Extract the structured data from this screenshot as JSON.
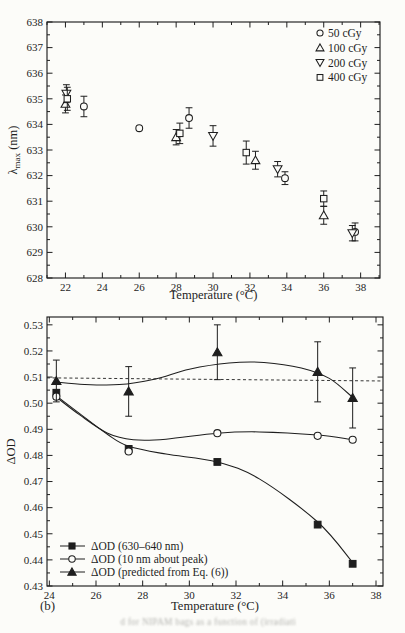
{
  "figure": {
    "panel_label": "(b)",
    "caption_fragment": "d for NIPAM bags as a function of (irradiati",
    "background": "#fcfcf9",
    "ink": "#1e1e1e"
  },
  "chart_data": [
    {
      "type": "scatter",
      "title": "",
      "xlabel": "Temperature (°C)",
      "ylabel": "λmax (nm)",
      "ylabel_parts": [
        {
          "t": "λ"
        },
        {
          "t": "max",
          "sub": true
        },
        {
          "t": " (nm)"
        }
      ],
      "xlim": [
        21,
        39.05
      ],
      "ylim": [
        628,
        638
      ],
      "xticks": [
        22,
        24,
        26,
        28,
        30,
        32,
        34,
        36,
        38
      ],
      "xminor_step": 1,
      "yticks": [
        628,
        629,
        630,
        631,
        632,
        633,
        634,
        635,
        636,
        637,
        638
      ],
      "yminor_step": 0.5,
      "y_decimals": 0,
      "grid": false,
      "legend": {
        "position": "top-right",
        "style": "marker"
      },
      "series": [
        {
          "name": "50 cGy",
          "marker": "circle",
          "fill": "open",
          "points": [
            [
              23.0,
              634.7,
              0.4
            ],
            [
              26.0,
              633.85,
              0
            ],
            [
              28.7,
              634.25,
              0.4
            ],
            [
              33.9,
              631.9,
              0.25
            ],
            [
              37.7,
              629.8,
              0.35
            ]
          ]
        },
        {
          "name": "100 cGy",
          "marker": "triangle-up",
          "fill": "open",
          "points": [
            [
              22.0,
              634.8,
              0.35
            ],
            [
              28.0,
              633.5,
              0.3
            ],
            [
              32.3,
              632.6,
              0.35
            ],
            [
              36.0,
              630.45,
              0.35
            ]
          ]
        },
        {
          "name": "200 cGy",
          "marker": "triangle-down",
          "fill": "open",
          "points": [
            [
              22.05,
              635.2,
              0.35
            ],
            [
              30.0,
              633.55,
              0.4
            ],
            [
              33.5,
              632.25,
              0.3
            ],
            [
              37.55,
              629.75,
              0.3
            ]
          ]
        },
        {
          "name": "400 cGy",
          "marker": "square",
          "fill": "open",
          "points": [
            [
              22.1,
              635.0,
              0.45
            ],
            [
              28.2,
              633.65,
              0.4
            ],
            [
              31.8,
              632.9,
              0.45
            ],
            [
              36.0,
              631.1,
              0.3
            ]
          ]
        }
      ]
    },
    {
      "type": "line+scatter",
      "title": "",
      "xlabel": "Temperature (°C)",
      "ylabel": "ΔOD",
      "ylabel_parts": [
        {
          "t": "ΔOD"
        }
      ],
      "xlim": [
        23.9,
        38.3
      ],
      "ylim": [
        0.43,
        0.533
      ],
      "xticks": [
        24,
        26,
        28,
        30,
        32,
        34,
        36,
        38
      ],
      "xminor_step": 1,
      "yticks": [
        0.43,
        0.44,
        0.45,
        0.46,
        0.47,
        0.48,
        0.49,
        0.5,
        0.51,
        0.52,
        0.53
      ],
      "yminor_step": 0.005,
      "y_decimals": 2,
      "grid": false,
      "ref_line": {
        "style": "dashed",
        "x1": 23.9,
        "y1": 0.5097,
        "x2": 38.3,
        "y2": 0.5085
      },
      "legend": {
        "position": "bottom-left",
        "style": "line-marker"
      },
      "series": [
        {
          "name": "ΔOD (630–640 nm)",
          "marker": "square",
          "fill": "filled",
          "points": [
            [
              24.3,
              0.504,
              0
            ],
            [
              27.4,
              0.4825,
              0
            ],
            [
              31.2,
              0.4775,
              0
            ],
            [
              35.5,
              0.4535,
              0
            ],
            [
              37.0,
              0.4385,
              0
            ]
          ],
          "curve": [
            [
              24.2,
              0.5035
            ],
            [
              25.3,
              0.496
            ],
            [
              26.5,
              0.488
            ],
            [
              27.4,
              0.4835
            ],
            [
              29.0,
              0.4805
            ],
            [
              31.2,
              0.4775
            ],
            [
              33.0,
              0.471
            ],
            [
              35.5,
              0.4545
            ],
            [
              37.0,
              0.439
            ]
          ]
        },
        {
          "name": "ΔOD (10 nm about peak)",
          "marker": "circle",
          "fill": "open",
          "points": [
            [
              24.3,
              0.5025,
              0
            ],
            [
              27.4,
              0.4815,
              0
            ],
            [
              31.2,
              0.4885,
              0
            ],
            [
              35.5,
              0.4875,
              0
            ],
            [
              37.0,
              0.486,
              0
            ]
          ],
          "curve": [
            [
              24.2,
              0.503
            ],
            [
              25.3,
              0.4955
            ],
            [
              26.5,
              0.4885
            ],
            [
              27.6,
              0.486
            ],
            [
              29.0,
              0.4862
            ],
            [
              31.2,
              0.4885
            ],
            [
              33.0,
              0.489
            ],
            [
              35.5,
              0.4878
            ],
            [
              37.0,
              0.486
            ]
          ]
        },
        {
          "name": "ΔOD (predicted from Eq. (6))",
          "marker": "triangle-up",
          "fill": "filled",
          "points": [
            [
              24.3,
              0.5085,
              0.008
            ],
            [
              27.4,
              0.5045,
              0.0095
            ],
            [
              31.2,
              0.5195,
              0.0105
            ],
            [
              35.5,
              0.512,
              0.0115
            ],
            [
              37.0,
              0.502,
              0.0115
            ]
          ],
          "curve": [
            [
              24.2,
              0.5082
            ],
            [
              25.5,
              0.5072
            ],
            [
              27.0,
              0.5071
            ],
            [
              28.5,
              0.5092
            ],
            [
              30.0,
              0.513
            ],
            [
              31.7,
              0.5154
            ],
            [
              33.2,
              0.5156
            ],
            [
              34.8,
              0.5135
            ],
            [
              36.0,
              0.5095
            ],
            [
              37.0,
              0.5022
            ]
          ]
        }
      ]
    }
  ]
}
